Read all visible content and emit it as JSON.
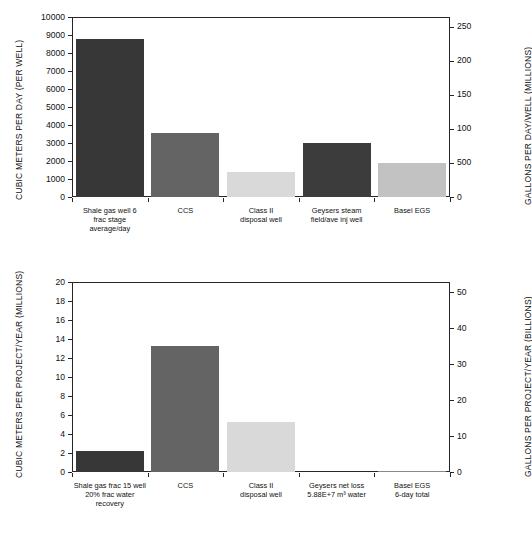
{
  "figure": {
    "background": "#ffffff",
    "axis_color": "#262626",
    "panels": [
      "top",
      "bottom"
    ]
  },
  "chart_data": [
    {
      "id": "top",
      "type": "bar",
      "title": "",
      "xlabel": "",
      "ylabel": "CUBIC METERS PER DAY (PER WELL)",
      "y2label": "GALLONS PER DAY/WELL (MILLIONS)",
      "ylim": [
        0,
        10000
      ],
      "y2lim": [
        0,
        264
      ],
      "grid": false,
      "legend": "none",
      "categories": [
        "Shale gas well 6 frac stage average/day",
        "CCS",
        "Class II disposal well",
        "Geysers steam field/ave inj well",
        "Basel EGS"
      ],
      "category_lines": [
        [
          "Shale gas well 6",
          "frac stage",
          "average/day"
        ],
        [
          "CCS"
        ],
        [
          "Class II",
          "disposal well"
        ],
        [
          "Geysers steam",
          "field/ave inj well"
        ],
        [
          "Basel EGS"
        ]
      ],
      "values": [
        8800,
        3580,
        1400,
        3020,
        1900
      ],
      "bar_colors": [
        "#373737",
        "#646464",
        "#d9d9d9",
        "#3c3c3c",
        "#c2c2c2"
      ],
      "yticks": [
        0,
        1000,
        2000,
        3000,
        4000,
        5000,
        6000,
        7000,
        8000,
        9000,
        10000
      ],
      "ytick_labels": [
        "0",
        "1000",
        "2000",
        "3000",
        "4000",
        "5000",
        "6000",
        "7000",
        "8000",
        "9000",
        "10000"
      ],
      "y2ticks": [
        0,
        50,
        100,
        150,
        200,
        250
      ],
      "y2tick_labels": [
        "0",
        "500",
        "100",
        "150",
        "200",
        "250"
      ]
    },
    {
      "id": "bottom",
      "type": "bar",
      "title": "",
      "xlabel": "",
      "ylabel": "CUBIC METERS PER PROJECT/YEAR (MILLIONS)",
      "y2label": "GALLONS PER PROJECT/YEAR (BILLIONS)",
      "ylim": [
        0,
        20
      ],
      "y2lim": [
        0,
        52.8
      ],
      "grid": false,
      "legend": "none",
      "categories": [
        "Shale gas frac 15 well 20% frac water recovery",
        "CCS",
        "Class II disposal well",
        "Geysers net loss 5.88E+7 m³ water",
        "Basel EGS 6-day total"
      ],
      "category_lines": [
        [
          "Shale gas frac 15 well",
          "20% frac water",
          "recovery"
        ],
        [
          "CCS"
        ],
        [
          "Class II",
          "disposal well"
        ],
        [
          "Geysers net loss",
          "5.88E+7 m³ water"
        ],
        [
          "Basel EGS",
          "6-day total"
        ]
      ],
      "values": [
        2.2,
        13.3,
        5.3,
        0.0,
        0.08
      ],
      "bar_colors": [
        "#373737",
        "#646464",
        "#d9d9d9",
        "#3c3c3c",
        "#8a8a8a"
      ],
      "yticks": [
        0,
        2,
        4,
        6,
        8,
        10,
        12,
        14,
        16,
        18,
        20
      ],
      "ytick_labels": [
        "0",
        "2",
        "4",
        "6",
        "8",
        "10",
        "12",
        "14",
        "16",
        "18",
        "20"
      ],
      "y2ticks": [
        0,
        10,
        20,
        30,
        40,
        50
      ],
      "y2tick_labels": [
        "0",
        "10",
        "20",
        "30",
        "40",
        "50"
      ]
    }
  ]
}
